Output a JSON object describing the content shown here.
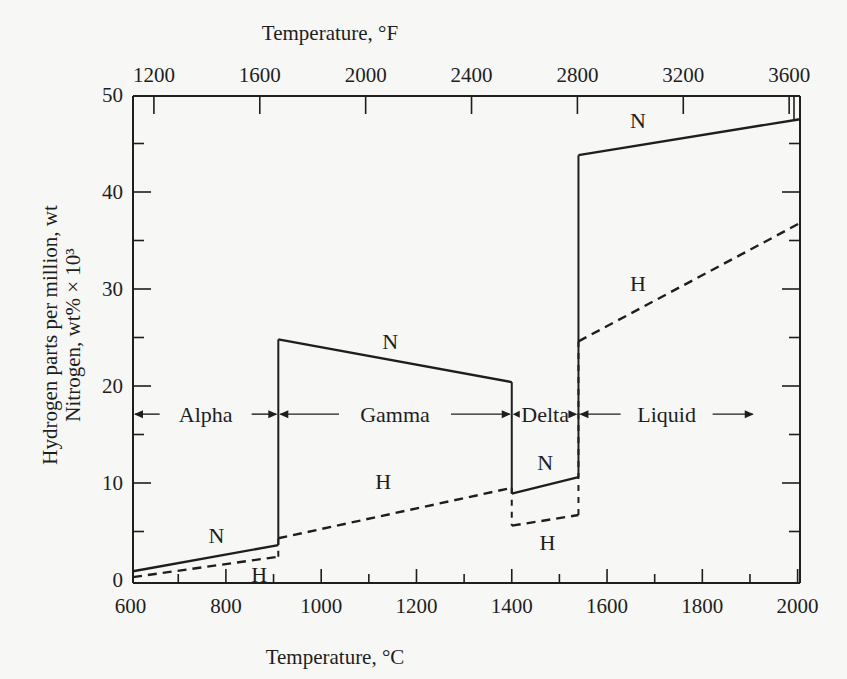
{
  "chart_data": {
    "type": "line",
    "title": "",
    "xlabel": "Temperature, °C",
    "x2label": "Temperature, °F",
    "ylabel_lines": [
      "Hydrogen parts per million, wt",
      "Nitrogen, wt% × 10³"
    ],
    "xlim": [
      605,
      2005
    ],
    "ylim": [
      0,
      50
    ],
    "grid": false,
    "x_ticks_major": [
      600,
      800,
      1000,
      1200,
      1400,
      1600,
      1800,
      2000
    ],
    "x_ticks_minor": [
      700,
      900,
      1100,
      1300,
      1500,
      1700,
      1900
    ],
    "x_tick_labels": [
      "600",
      "800",
      "1000",
      "1200",
      "1400",
      "1600",
      "1800",
      "2000"
    ],
    "x2_ticks_F": [
      1200,
      1600,
      2000,
      2400,
      2800,
      3200,
      3600
    ],
    "x2_tick_labels": [
      "1200",
      "1600",
      "2000",
      "2400",
      "2800",
      "3200",
      "3600"
    ],
    "y_ticks_major": [
      0,
      10,
      20,
      30,
      40,
      50
    ],
    "y_ticks_minor": [
      5,
      15,
      25,
      35,
      45
    ],
    "y_tick_labels": [
      "0",
      "10",
      "20",
      "30",
      "40",
      "50"
    ],
    "series": [
      {
        "name": "N",
        "label": "N",
        "style": "solid",
        "segments": [
          {
            "phase": "Alpha",
            "x": [
              605,
              910
            ],
            "y": [
              0.9,
              3.6
            ]
          },
          {
            "phase": "Gamma",
            "x": [
              910,
              1400
            ],
            "y": [
              24.8,
              20.4
            ]
          },
          {
            "phase": "Delta",
            "x": [
              1400,
              1540
            ],
            "y": [
              8.9,
              10.6
            ]
          },
          {
            "phase": "Liquid",
            "x": [
              1540,
              2005
            ],
            "y": [
              43.8,
              47.5
            ]
          }
        ]
      },
      {
        "name": "H",
        "label": "H",
        "style": "dashed",
        "segments": [
          {
            "phase": "Alpha",
            "x": [
              605,
              910
            ],
            "y": [
              0.3,
              2.4
            ]
          },
          {
            "phase": "Gamma",
            "x": [
              910,
              1400
            ],
            "y": [
              4.3,
              9.5
            ]
          },
          {
            "phase": "Delta",
            "x": [
              1400,
              1540
            ],
            "y": [
              5.6,
              6.7
            ]
          },
          {
            "phase": "Liquid",
            "x": [
              1540,
              2005
            ],
            "y": [
              24.6,
              36.8
            ]
          }
        ]
      }
    ],
    "series_labels": [
      {
        "text": "N",
        "x": 780,
        "y": 4.6
      },
      {
        "text": "H",
        "x": 870,
        "y": 0.6
      },
      {
        "text": "N",
        "x": 1145,
        "y": 24.6
      },
      {
        "text": "H",
        "x": 1130,
        "y": 10.2
      },
      {
        "text": "N",
        "x": 1470,
        "y": 12.2
      },
      {
        "text": "H",
        "x": 1475,
        "y": 3.9
      },
      {
        "text": "N",
        "x": 1665,
        "y": 47.4
      },
      {
        "text": "H",
        "x": 1665,
        "y": 30.6
      }
    ],
    "phase_regions": [
      {
        "name": "Alpha",
        "from": 605,
        "to": 910,
        "y": 17.1
      },
      {
        "name": "Gamma",
        "from": 910,
        "to": 1400,
        "y": 17.1
      },
      {
        "name": "Delta",
        "from": 1400,
        "to": 1540,
        "y": 17.1
      },
      {
        "name": "Liquid",
        "from": 1540,
        "to": 1910,
        "y": 17.1,
        "open_end": true
      }
    ],
    "phase_boundaries_C": [
      910,
      1400,
      1540
    ]
  }
}
